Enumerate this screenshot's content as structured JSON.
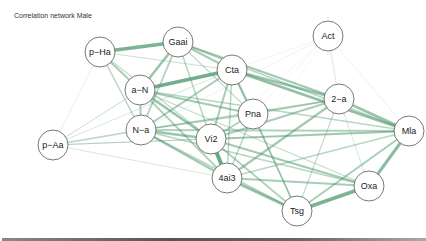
{
  "title": "Correlation network Male",
  "colors": {
    "positive_edge": "#4f9a6e",
    "negative_edge": "#e0a8a8",
    "node_fill": "#ffffff",
    "node_stroke": "#555555"
  },
  "nodes": [
    {
      "id": "p-Ha",
      "label": "p−Ha",
      "x": 100,
      "y": 52
    },
    {
      "id": "Gaai",
      "label": "Gaai",
      "x": 178,
      "y": 42
    },
    {
      "id": "Act",
      "label": "Act",
      "x": 328,
      "y": 36
    },
    {
      "id": "a-N",
      "label": "a−N",
      "x": 140,
      "y": 90
    },
    {
      "id": "Cta",
      "label": "Cta",
      "x": 232,
      "y": 70
    },
    {
      "id": "Pna",
      "label": "Pna",
      "x": 253,
      "y": 114
    },
    {
      "id": "2-a",
      "label": "2−a",
      "x": 339,
      "y": 99
    },
    {
      "id": "p-Aa",
      "label": "p−Aa",
      "x": 53,
      "y": 145
    },
    {
      "id": "N-a",
      "label": "N−a",
      "x": 141,
      "y": 130
    },
    {
      "id": "Vi2",
      "label": "Vi2",
      "x": 211,
      "y": 139
    },
    {
      "id": "Mla",
      "label": "Mla",
      "x": 409,
      "y": 131
    },
    {
      "id": "4ai3",
      "label": "4ai3",
      "x": 227,
      "y": 178
    },
    {
      "id": "Oxa",
      "label": "Oxa",
      "x": 369,
      "y": 186
    },
    {
      "id": "Tsg",
      "label": "Tsg",
      "x": 297,
      "y": 211
    }
  ],
  "edges": [
    {
      "from": "p-Ha",
      "to": "Gaai",
      "w": 3.5,
      "sign": "+"
    },
    {
      "from": "p-Ha",
      "to": "a-N",
      "w": 2.0,
      "sign": "+"
    },
    {
      "from": "p-Ha",
      "to": "N-a",
      "w": 1.5,
      "sign": "+"
    },
    {
      "from": "p-Ha",
      "to": "Vi2",
      "w": 1.2,
      "sign": "+"
    },
    {
      "from": "p-Ha",
      "to": "p-Aa",
      "w": 0.6,
      "sign": "+"
    },
    {
      "from": "p-Ha",
      "to": "Cta",
      "w": 1.0,
      "sign": "+"
    },
    {
      "from": "Gaai",
      "to": "a-N",
      "w": 2.5,
      "sign": "+"
    },
    {
      "from": "Gaai",
      "to": "N-a",
      "w": 1.8,
      "sign": "+"
    },
    {
      "from": "Gaai",
      "to": "Cta",
      "w": 2.0,
      "sign": "+"
    },
    {
      "from": "Gaai",
      "to": "2-a",
      "w": 2.2,
      "sign": "+"
    },
    {
      "from": "Gaai",
      "to": "Vi2",
      "w": 1.5,
      "sign": "+"
    },
    {
      "from": "Gaai",
      "to": "Pna",
      "w": 1.2,
      "sign": "+"
    },
    {
      "from": "Gaai",
      "to": "Mla",
      "w": 1.5,
      "sign": "+"
    },
    {
      "from": "a-N",
      "to": "Cta",
      "w": 3.8,
      "sign": "+"
    },
    {
      "from": "a-N",
      "to": "N-a",
      "w": 2.0,
      "sign": "+"
    },
    {
      "from": "a-N",
      "to": "Vi2",
      "w": 2.5,
      "sign": "+"
    },
    {
      "from": "a-N",
      "to": "Pna",
      "w": 2.2,
      "sign": "+"
    },
    {
      "from": "a-N",
      "to": "4ai3",
      "w": 1.8,
      "sign": "+"
    },
    {
      "from": "a-N",
      "to": "Mla",
      "w": 1.5,
      "sign": "+"
    },
    {
      "from": "a-N",
      "to": "p-Aa",
      "w": 1.0,
      "sign": "+"
    },
    {
      "from": "a-N",
      "to": "Oxa",
      "w": 1.2,
      "sign": "+"
    },
    {
      "from": "Cta",
      "to": "Pna",
      "w": 2.2,
      "sign": "+"
    },
    {
      "from": "Cta",
      "to": "Vi2",
      "w": 2.0,
      "sign": "+"
    },
    {
      "from": "Cta",
      "to": "2-a",
      "w": 2.5,
      "sign": "+"
    },
    {
      "from": "Cta",
      "to": "N-a",
      "w": 2.0,
      "sign": "+"
    },
    {
      "from": "Cta",
      "to": "Mla",
      "w": 2.8,
      "sign": "+"
    },
    {
      "from": "Cta",
      "to": "4ai3",
      "w": 1.5,
      "sign": "+"
    },
    {
      "from": "Cta",
      "to": "Act",
      "w": 0.6,
      "sign": "-"
    },
    {
      "from": "Pna",
      "to": "Vi2",
      "w": 1.8,
      "sign": "+"
    },
    {
      "from": "Pna",
      "to": "2-a",
      "w": 1.5,
      "sign": "+"
    },
    {
      "from": "Pna",
      "to": "Tsg",
      "w": 1.8,
      "sign": "+"
    },
    {
      "from": "Pna",
      "to": "4ai3",
      "w": 1.5,
      "sign": "+"
    },
    {
      "from": "Pna",
      "to": "N-a",
      "w": 1.5,
      "sign": "+"
    },
    {
      "from": "Pna",
      "to": "Act",
      "w": 0.6,
      "sign": "-"
    },
    {
      "from": "2-a",
      "to": "Mla",
      "w": 2.5,
      "sign": "+"
    },
    {
      "from": "2-a",
      "to": "Vi2",
      "w": 2.0,
      "sign": "+"
    },
    {
      "from": "2-a",
      "to": "4ai3",
      "w": 2.2,
      "sign": "+"
    },
    {
      "from": "2-a",
      "to": "Tsg",
      "w": 1.2,
      "sign": "+"
    },
    {
      "from": "2-a",
      "to": "N-a",
      "w": 1.5,
      "sign": "+"
    },
    {
      "from": "2-a",
      "to": "Oxa",
      "w": 0.8,
      "sign": "+"
    },
    {
      "from": "2-a",
      "to": "Act",
      "w": 0.8,
      "sign": "+"
    },
    {
      "from": "Act",
      "to": "Vi2",
      "w": 0.6,
      "sign": "-"
    },
    {
      "from": "Act",
      "to": "N-a",
      "w": 0.5,
      "sign": "+"
    },
    {
      "from": "Act",
      "to": "Mla",
      "w": 0.5,
      "sign": "+"
    },
    {
      "from": "Act",
      "to": "4ai3",
      "w": 0.5,
      "sign": "-"
    },
    {
      "from": "N-a",
      "to": "Vi2",
      "w": 2.5,
      "sign": "+"
    },
    {
      "from": "N-a",
      "to": "4ai3",
      "w": 2.2,
      "sign": "+"
    },
    {
      "from": "N-a",
      "to": "p-Aa",
      "w": 1.5,
      "sign": "+"
    },
    {
      "from": "N-a",
      "to": "Mla",
      "w": 1.8,
      "sign": "+"
    },
    {
      "from": "N-a",
      "to": "Oxa",
      "w": 1.5,
      "sign": "+"
    },
    {
      "from": "N-a",
      "to": "Tsg",
      "w": 1.5,
      "sign": "+"
    },
    {
      "from": "p-Aa",
      "to": "Vi2",
      "w": 1.2,
      "sign": "+"
    },
    {
      "from": "p-Aa",
      "to": "Mla",
      "w": 0.7,
      "sign": "+"
    },
    {
      "from": "p-Aa",
      "to": "4ai3",
      "w": 0.8,
      "sign": "+"
    },
    {
      "from": "p-Aa",
      "to": "Cta",
      "w": 0.8,
      "sign": "+"
    },
    {
      "from": "Vi2",
      "to": "4ai3",
      "w": 4.0,
      "sign": "+"
    },
    {
      "from": "Vi2",
      "to": "Mla",
      "w": 2.0,
      "sign": "+"
    },
    {
      "from": "Vi2",
      "to": "Oxa",
      "w": 2.2,
      "sign": "+"
    },
    {
      "from": "Vi2",
      "to": "Tsg",
      "w": 1.8,
      "sign": "+"
    },
    {
      "from": "4ai3",
      "to": "Tsg",
      "w": 2.8,
      "sign": "+"
    },
    {
      "from": "4ai3",
      "to": "Oxa",
      "w": 2.0,
      "sign": "+"
    },
    {
      "from": "4ai3",
      "to": "Mla",
      "w": 1.5,
      "sign": "+"
    },
    {
      "from": "Mla",
      "to": "Oxa",
      "w": 3.0,
      "sign": "+"
    },
    {
      "from": "Mla",
      "to": "Tsg",
      "w": 2.0,
      "sign": "+"
    },
    {
      "from": "Oxa",
      "to": "Tsg",
      "w": 3.5,
      "sign": "+"
    },
    {
      "from": "Tsg",
      "to": "Cta",
      "w": 1.2,
      "sign": "+"
    }
  ]
}
